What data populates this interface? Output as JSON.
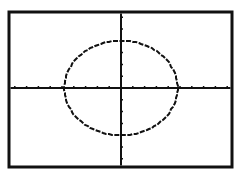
{
  "screen": {
    "type": "graphing-calculator-display",
    "background": "#ffffff",
    "ink": "#111111"
  },
  "chart_data": {
    "type": "line",
    "title": "",
    "xlabel": "",
    "ylabel": "",
    "description": "Ellipse centered at origin",
    "xlim": [
      -10,
      10
    ],
    "ylim": [
      -7,
      7
    ],
    "grid": false,
    "x_tick_step": 1,
    "y_tick_step": 1,
    "series": [
      {
        "name": "ellipse",
        "center": [
          0,
          0
        ],
        "rx": 4.8,
        "ry": 4
      }
    ]
  },
  "layout": {
    "frame": {
      "x": 9,
      "y": 12,
      "w": 223,
      "h": 155,
      "stroke": 3
    },
    "origin": {
      "x": 121,
      "y": 88
    },
    "px_per_unit_x": 11.8,
    "px_per_unit_y": 11.8,
    "tick_len": 2
  }
}
